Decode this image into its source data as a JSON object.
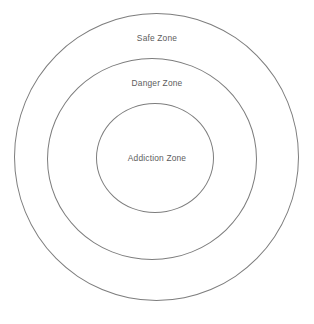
{
  "diagram": {
    "type": "concentric-circles",
    "title": "",
    "background_color": "#ffffff",
    "stroke_color": "#7d7d7d",
    "text_color": "#5c5c5c",
    "center": {
      "x": 156,
      "y": 157
    },
    "zones": [
      {
        "id": "safe",
        "label": "Safe Zone",
        "level": "outer",
        "radius": 143,
        "label_position": "top-of-ring"
      },
      {
        "id": "danger",
        "label": "Danger Zone",
        "level": "middle",
        "radius": 101,
        "label_position": "top-of-ring"
      },
      {
        "id": "addiction",
        "label": "Addiction Zone",
        "level": "inner",
        "radius": 57,
        "label_position": "center"
      }
    ]
  }
}
